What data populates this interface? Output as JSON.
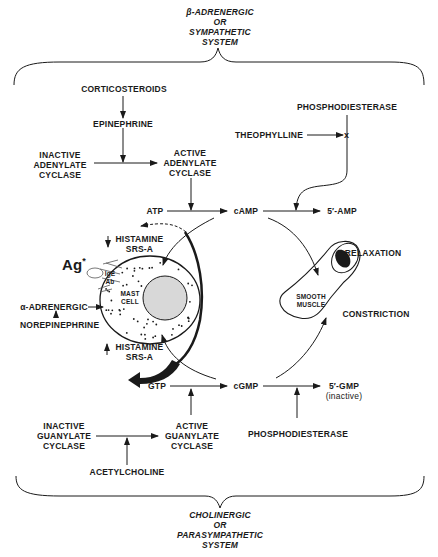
{
  "systems": {
    "top": [
      "β-ADRENERGIC",
      "OR",
      "SYMPATHETIC",
      "SYSTEM"
    ],
    "bottom": [
      "CHOLINERGIC",
      "OR",
      "PARASYMPATHETIC",
      "SYSTEM"
    ]
  },
  "nodes": {
    "corticosteroids": "CORTICOSTEROIDS",
    "epinephrine": "EPINEPHRINE",
    "inactive_adenylate": [
      "INACTIVE",
      "ADENYLATE",
      "CYCLASE"
    ],
    "active_adenylate": [
      "ACTIVE",
      "ADENYLATE",
      "CYCLASE"
    ],
    "phosphodiesterase_top": "PHOSPHODIESTERASE",
    "theophylline": "THEOPHYLLINE",
    "block_mark": "x",
    "atp": "ATP",
    "camp": "cAMP",
    "five_amp": "5′-AMP",
    "histamine_down": [
      "HISTAMINE",
      "SRS-A"
    ],
    "histamine_up": [
      "HISTAMINE",
      "SRS-A"
    ],
    "ag": "Ag",
    "ag_star": "*",
    "ige": [
      "IgE",
      "Ab"
    ],
    "mast_cell": [
      "MAST",
      "CELL"
    ],
    "alpha_adrenergic": "α-ADRENERGIC",
    "norepinephrine": "NOREPINEPHRINE",
    "relaxation": "RELAXATION",
    "smooth_muscle": [
      "SMOOTH",
      "MUSCLE"
    ],
    "constriction": "CONSTRICTION",
    "gtp": "GTP",
    "cgmp": "cGMP",
    "five_gmp": "5′-GMP",
    "five_gmp_note": "(inactive)",
    "inactive_guanylate": [
      "INACTIVE",
      "GUANYLATE",
      "CYCLASE"
    ],
    "active_guanylate": [
      "ACTIVE",
      "GUANYLATE",
      "CYCLASE"
    ],
    "phosphodiesterase_bottom": "PHOSPHODIESTERASE",
    "acetylcholine": "ACETYLCHOLINE"
  }
}
